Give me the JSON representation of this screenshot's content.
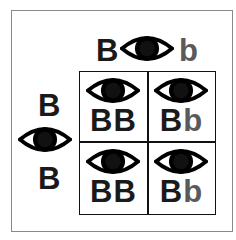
{
  "colors": {
    "dominant": "#1a1a1a",
    "recessive": "#5a5a5a",
    "grid": "#111111",
    "frame": "#8a8a8a"
  },
  "top_parent": {
    "allele1": "B",
    "allele2": "b",
    "phenotype_icon": "eye-icon"
  },
  "left_parent": {
    "allele1": "B",
    "allele2": "B",
    "phenotype_icon": "eye-icon"
  },
  "cells": [
    {
      "row": 1,
      "col": 1,
      "allele1": "B",
      "allele2": "B",
      "phenotype_icon": "eye-icon"
    },
    {
      "row": 1,
      "col": 2,
      "allele1": "B",
      "allele2": "b",
      "phenotype_icon": "eye-icon"
    },
    {
      "row": 2,
      "col": 1,
      "allele1": "B",
      "allele2": "B",
      "phenotype_icon": "eye-icon"
    },
    {
      "row": 2,
      "col": 2,
      "allele1": "B",
      "allele2": "b",
      "phenotype_icon": "eye-icon"
    }
  ]
}
